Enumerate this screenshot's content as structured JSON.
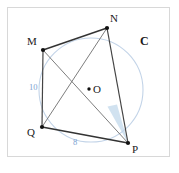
{
  "figure": {
    "kind": "cyclic-quadrilateral-diagram",
    "circle_label": "C",
    "center_label": "O",
    "vertices": [
      {
        "name": "M",
        "label": "M",
        "x": 43,
        "y": 50
      },
      {
        "name": "N",
        "label": "N",
        "x": 107,
        "y": 28
      },
      {
        "name": "P",
        "label": "P",
        "x": 128,
        "y": 143
      },
      {
        "name": "Q",
        "label": "Q",
        "x": 42,
        "y": 127
      }
    ],
    "center": {
      "x": 91,
      "y": 90,
      "radius": 52
    },
    "sides": [
      {
        "name": "MN",
        "from": "M",
        "to": "N",
        "length_label": ""
      },
      {
        "name": "NP",
        "from": "N",
        "to": "P",
        "length_label": ""
      },
      {
        "name": "PQ",
        "from": "P",
        "to": "Q",
        "length_label": "8"
      },
      {
        "name": "QM",
        "from": "Q",
        "to": "M",
        "length_label": "10"
      }
    ],
    "diagonals": [
      {
        "name": "MP",
        "from": "M",
        "to": "P"
      },
      {
        "name": "NQ",
        "from": "N",
        "to": "Q"
      }
    ],
    "angle_marks": [
      {
        "name": "angle-at-P",
        "vertex": "P",
        "between": [
          "PM",
          "PN"
        ],
        "fill": "#cfe0ef"
      }
    ],
    "colors": {
      "circle_stroke": "#c3d4e8",
      "chord_stroke": "#3a3a3a",
      "diagonal_stroke": "#6e6e6e",
      "point_fill": "#111111",
      "length_text": "#7d9fd1",
      "label_text": "#1a1a1a",
      "frame_border": "#d8d8d8",
      "angle_fill": "#cfe0ef"
    }
  }
}
